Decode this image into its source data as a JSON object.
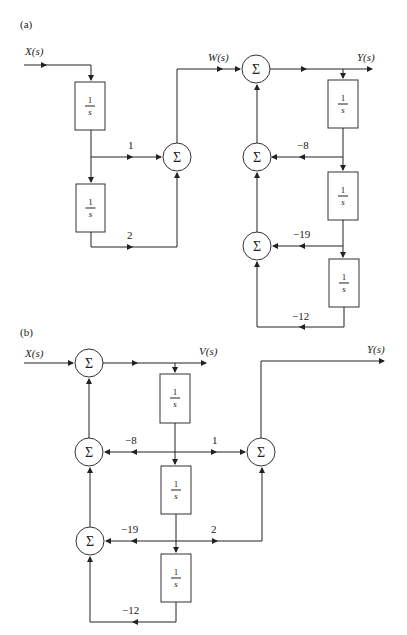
{
  "figure": {
    "panels": [
      {
        "id": "a",
        "label": "(a)",
        "signals": {
          "input": "X(s)",
          "intermediate": "W(s)",
          "output": "Y(s)"
        },
        "integrators": [
          {
            "label_num": "1",
            "label_den": "s"
          },
          {
            "label_num": "1",
            "label_den": "s"
          },
          {
            "label_num": "1",
            "label_den": "s"
          },
          {
            "label_num": "1",
            "label_den": "s"
          },
          {
            "label_num": "1",
            "label_den": "s"
          }
        ],
        "summers": [
          "Σ",
          "Σ",
          "Σ",
          "Σ"
        ],
        "gains": {
          "g1": "1",
          "g2": "2",
          "g_m8": "−8",
          "g_m19": "−19",
          "g_m12": "−12"
        }
      },
      {
        "id": "b",
        "label": "(b)",
        "signals": {
          "input": "X(s)",
          "intermediate": "V(s)",
          "output": "Y(s)"
        },
        "integrators": [
          {
            "label_num": "1",
            "label_den": "s"
          },
          {
            "label_num": "1",
            "label_den": "s"
          },
          {
            "label_num": "1",
            "label_den": "s"
          }
        ],
        "summers": [
          "Σ",
          "Σ",
          "Σ",
          "Σ"
        ],
        "gains": {
          "g_m8": "−8",
          "g1": "1",
          "g_m19": "−19",
          "g2": "2",
          "g_m12": "−12"
        }
      }
    ]
  }
}
